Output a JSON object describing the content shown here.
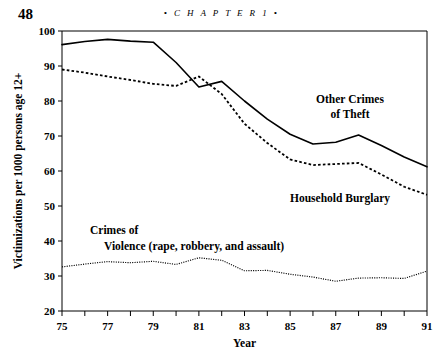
{
  "page": {
    "folio": "48",
    "running_head": "• C H A P T E R  1 •"
  },
  "chart_data": {
    "type": "line",
    "title": "",
    "xlabel": "Year",
    "ylabel": "Victimizations per 1000 persons age 12+",
    "xlim": [
      75,
      91
    ],
    "ylim": [
      20,
      100
    ],
    "grid": false,
    "legend_position": "inline-annotations",
    "x": [
      75,
      76,
      77,
      78,
      79,
      80,
      81,
      82,
      83,
      84,
      85,
      86,
      87,
      88,
      89,
      90,
      91
    ],
    "xtick_labels": [
      "75",
      "77",
      "79",
      "81",
      "83",
      "85",
      "87",
      "89",
      "91"
    ],
    "xtick_values": [
      75,
      77,
      79,
      81,
      83,
      85,
      87,
      89,
      91
    ],
    "ytick_labels": [
      "20",
      "30",
      "40",
      "50",
      "60",
      "70",
      "80",
      "90",
      "100"
    ],
    "ytick_values": [
      20,
      30,
      40,
      50,
      60,
      70,
      80,
      90,
      100
    ],
    "series": [
      {
        "name": "Other Crimes of Theft",
        "style": "solid",
        "label_lines": [
          "Other Crimes",
          "of Theft"
        ],
        "values": [
          96.1,
          97.0,
          97.6,
          97.1,
          96.8,
          91.0,
          84.0,
          85.6,
          80.0,
          74.8,
          70.5,
          67.7,
          68.2,
          70.3,
          67.3,
          64.0,
          61.2
        ]
      },
      {
        "name": "Household Burglary",
        "style": "dashed",
        "label_lines": [
          "Household Burglary"
        ],
        "values": [
          89.0,
          88.1,
          87.0,
          86.0,
          84.9,
          84.3,
          87.0,
          82.0,
          73.5,
          68.0,
          63.3,
          61.7,
          62.0,
          62.3,
          59.0,
          55.5,
          53.2
        ]
      },
      {
        "name": "Crimes of Violence (rape, robbery, and assault)",
        "style": "dotted",
        "label_lines": [
          "Crimes of",
          "Violence (rape, robbery, and assault)"
        ],
        "values": [
          32.6,
          33.4,
          34.1,
          33.8,
          34.2,
          33.3,
          35.2,
          34.5,
          31.5,
          31.6,
          30.5,
          29.7,
          28.5,
          29.4,
          29.5,
          29.3,
          31.4
        ]
      }
    ]
  }
}
